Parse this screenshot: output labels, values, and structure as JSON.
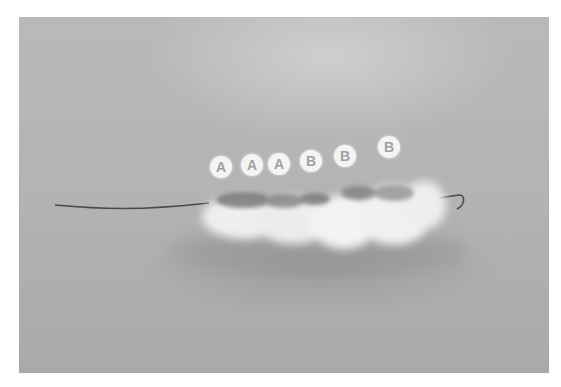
{
  "image": {
    "description": "Grayscale photo of a fuzzy fiber bundle threaded on a thin wire, with six circular segment labels",
    "colors": {
      "background": "#b5b5b5",
      "fiber_light": "#f2f2f2",
      "fiber_dark": "#6a6a6a",
      "wire": "#4a4a4a",
      "label_bg": "#f4f4f4",
      "label_text": "#a0a0a0"
    }
  },
  "labels": [
    {
      "text": "A",
      "x": 210,
      "y": 156
    },
    {
      "text": "A",
      "x": 241,
      "y": 154
    },
    {
      "text": "A",
      "x": 268,
      "y": 153
    },
    {
      "text": "B",
      "x": 300,
      "y": 150
    },
    {
      "text": "B",
      "x": 334,
      "y": 145
    },
    {
      "text": "B",
      "x": 378,
      "y": 136
    }
  ]
}
